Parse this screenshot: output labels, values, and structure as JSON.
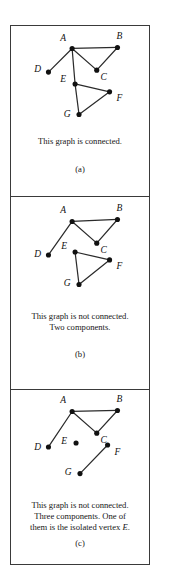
{
  "figure": {
    "panels": [
      {
        "id": "a",
        "sublabel": "(a)",
        "caption_lines": [
          "This graph is connected."
        ],
        "caption_tail_italic": "",
        "caption_tail_period": "",
        "vertices": [
          {
            "name": "A",
            "label": "A",
            "cx": 62,
            "cy": 22,
            "label_x": 53,
            "label_y": 13
          },
          {
            "name": "B",
            "label": "B",
            "cx": 108,
            "cy": 21,
            "label_x": 110,
            "label_y": 11
          },
          {
            "name": "C",
            "label": "C",
            "cx": 87,
            "cy": 44,
            "label_x": 94,
            "label_y": 52
          },
          {
            "name": "D",
            "label": "D",
            "cx": 38,
            "cy": 46,
            "label_x": 27,
            "label_y": 44
          },
          {
            "name": "E",
            "label": "E",
            "cx": 65,
            "cy": 58,
            "label_x": 53,
            "label_y": 54
          },
          {
            "name": "F",
            "label": "F",
            "cx": 100,
            "cy": 66,
            "label_x": 110,
            "label_y": 73
          },
          {
            "name": "G",
            "label": "G",
            "cx": 69,
            "cy": 89,
            "label_x": 57,
            "label_y": 89
          }
        ],
        "edges": [
          {
            "from": "A",
            "to": "B"
          },
          {
            "from": "A",
            "to": "C"
          },
          {
            "from": "B",
            "to": "C"
          },
          {
            "from": "A",
            "to": "D"
          },
          {
            "from": "A",
            "to": "E"
          },
          {
            "from": "E",
            "to": "F"
          },
          {
            "from": "E",
            "to": "G"
          },
          {
            "from": "F",
            "to": "G"
          }
        ]
      },
      {
        "id": "b",
        "sublabel": "(b)",
        "caption_lines": [
          "This graph is not connected.",
          "Two components."
        ],
        "caption_tail_italic": "",
        "caption_tail_period": "",
        "vertices": [
          {
            "name": "A",
            "label": "A",
            "cx": 62,
            "cy": 24,
            "label_x": 53,
            "label_y": 14
          },
          {
            "name": "B",
            "label": "B",
            "cx": 108,
            "cy": 22,
            "label_x": 110,
            "label_y": 12
          },
          {
            "name": "C",
            "label": "C",
            "cx": 87,
            "cy": 46,
            "label_x": 94,
            "label_y": 54
          },
          {
            "name": "D",
            "label": "D",
            "cx": 38,
            "cy": 58,
            "label_x": 27,
            "label_y": 58
          },
          {
            "name": "E",
            "label": "E",
            "cx": 65,
            "cy": 55,
            "label_x": 54,
            "label_y": 50
          },
          {
            "name": "F",
            "label": "F",
            "cx": 100,
            "cy": 63,
            "label_x": 110,
            "label_y": 70
          },
          {
            "name": "G",
            "label": "G",
            "cx": 69,
            "cy": 88,
            "label_x": 57,
            "label_y": 87
          }
        ],
        "edges": [
          {
            "from": "A",
            "to": "B"
          },
          {
            "from": "A",
            "to": "C"
          },
          {
            "from": "B",
            "to": "C"
          },
          {
            "from": "A",
            "to": "D"
          },
          {
            "from": "E",
            "to": "F"
          },
          {
            "from": "E",
            "to": "G"
          },
          {
            "from": "F",
            "to": "G"
          }
        ]
      },
      {
        "id": "c",
        "sublabel": "(c)",
        "caption_lines": [
          "This graph is not connected.",
          "Three components. One of",
          "them is the isolated vertex"
        ],
        "caption_tail_italic": "E",
        "caption_tail_period": ".",
        "vertices": [
          {
            "name": "A",
            "label": "A",
            "cx": 62,
            "cy": 21,
            "label_x": 53,
            "label_y": 11
          },
          {
            "name": "B",
            "label": "B",
            "cx": 108,
            "cy": 20,
            "label_x": 110,
            "label_y": 10
          },
          {
            "name": "C",
            "label": "C",
            "cx": 87,
            "cy": 43,
            "label_x": 94,
            "label_y": 51
          },
          {
            "name": "D",
            "label": "D",
            "cx": 38,
            "cy": 57,
            "label_x": 27,
            "label_y": 58
          },
          {
            "name": "E",
            "label": "E",
            "cx": 66,
            "cy": 53,
            "label_x": 54,
            "label_y": 52
          },
          {
            "name": "F",
            "label": "F",
            "cx": 98,
            "cy": 55,
            "label_x": 108,
            "label_y": 63
          },
          {
            "name": "G",
            "label": "G",
            "cx": 70,
            "cy": 84,
            "label_x": 58,
            "label_y": 83
          }
        ],
        "edges": [
          {
            "from": "A",
            "to": "B"
          },
          {
            "from": "A",
            "to": "C"
          },
          {
            "from": "B",
            "to": "C"
          },
          {
            "from": "A",
            "to": "D"
          },
          {
            "from": "F",
            "to": "G"
          }
        ]
      }
    ],
    "style": {
      "vertex_color": "#111111",
      "edge_color": "#2b2b2b",
      "frame_color": "#3a3a3a",
      "background": "#ffffff",
      "vertex_radius": 2.6,
      "edge_width": 1.25
    }
  }
}
